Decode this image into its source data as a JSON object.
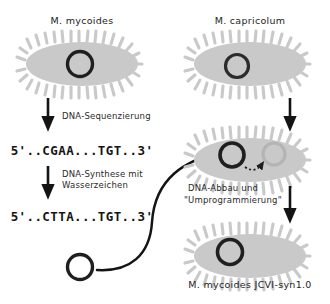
{
  "figure": {
    "type": "diagram",
    "background_color": "#ffffff",
    "cell_body_color": "#c9c9c9",
    "cell_body_color_faded": "#d8d8d8",
    "genome_ring_color": "#1f1f1f",
    "genome_ring_faded_color": "#b4b4b4",
    "arrow_color": "#141414",
    "text_color": "#2a2a2a"
  },
  "left_column": {
    "cell_label": "M. mycoides",
    "step1_label": "DNA-Sequenzierung",
    "sequence_1": "5'..CGAA...TGT..3'",
    "step2_label_line1": "DNA-Synthese mit",
    "step2_label_line2": "Wasserzeichen",
    "sequence_2": "5'..CTTA...TGT..3'"
  },
  "right_column": {
    "cell_label": "M. capricolum",
    "process_label_line1": "DNA-Abbau und",
    "process_label_line2": "\"Umprogrammierung\"",
    "result_label": "M. mycoides JCVI-syn1.0"
  },
  "icons": {
    "down_arrow": "down-arrow-icon",
    "curved_transfer_arrow": "curved-transfer-arrow-icon",
    "dotted_degradation_arrow": "dotted-degradation-arrow-icon",
    "bacterium_cell": "bacterium-cell-icon",
    "genome_ring": "genome-ring-icon"
  }
}
